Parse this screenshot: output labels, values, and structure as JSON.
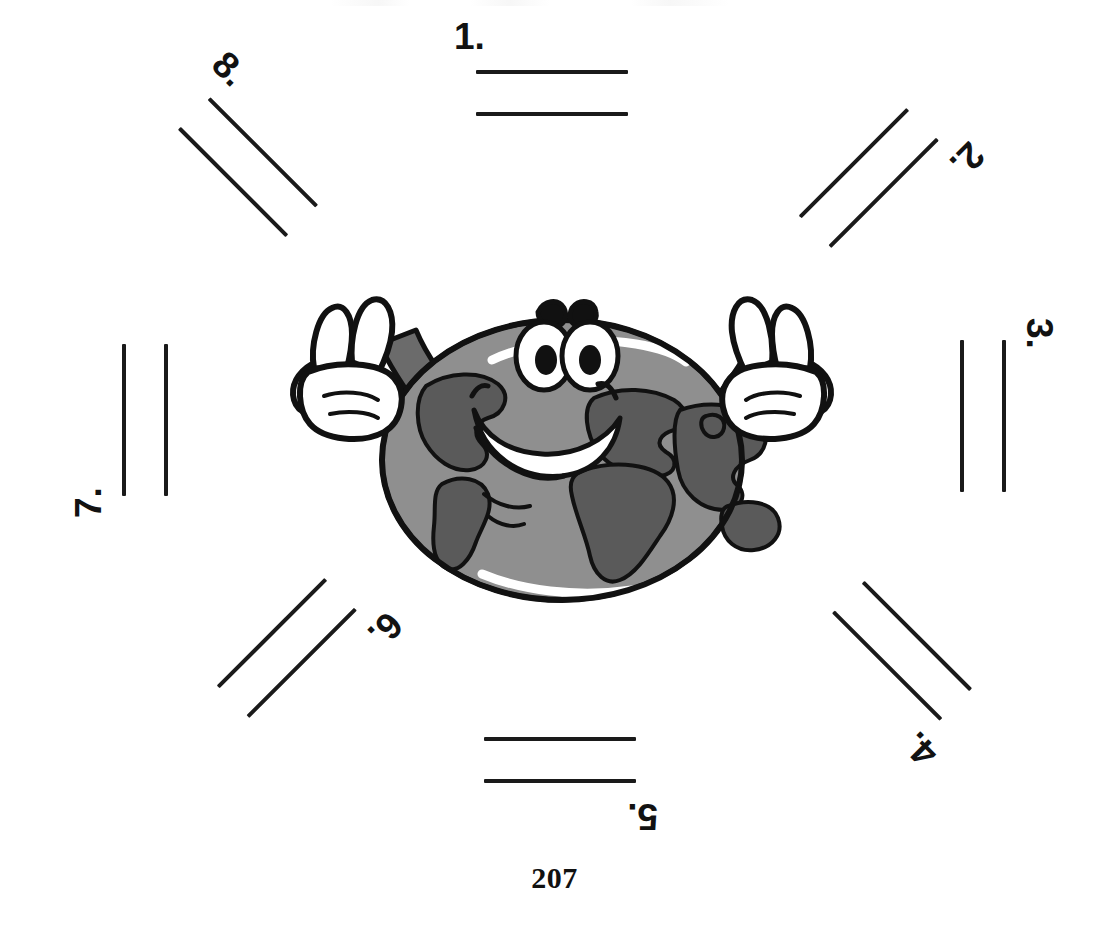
{
  "page": {
    "page_number": "207",
    "background_color": "#ffffff",
    "ink_color": "#1a1a1a"
  },
  "mascot": {
    "name": "smiling-earth-globe-with-peace-sign-hands",
    "globe_ocean_color": "#8f8f8f",
    "globe_land_color": "#5a5a5a",
    "outline_color": "#111111",
    "glove_color": "#ffffff",
    "arm_color": "#6b6b6b",
    "eye_white_color": "#ffffff",
    "pupil_color": "#111111",
    "tongue_color": "#c9c9c9",
    "teeth_color": "#ffffff",
    "expression": "smiling-open-mouth",
    "gesture": "both-hands-v-sign"
  },
  "items": [
    {
      "label": "1.",
      "rotation": 0,
      "left": 454,
      "top": 18,
      "lines": 2
    },
    {
      "label": "2.",
      "rotation": 135,
      "left": 778,
      "top": 130,
      "lines": 2
    },
    {
      "label": "3.",
      "rotation": 90,
      "left": 898,
      "top": 358,
      "lines": 2
    },
    {
      "label": "4.",
      "rotation": 225,
      "left": 790,
      "top": 600,
      "lines": 2
    },
    {
      "label": "5.",
      "rotation": 180,
      "left": 458,
      "top": 715,
      "lines": 2
    },
    {
      "label": "6.",
      "rotation": 135,
      "left": 196,
      "top": 600,
      "lines": 2
    },
    {
      "label": "7.",
      "rotation": 270,
      "left": 30,
      "top": 358,
      "lines": 2
    },
    {
      "label": "8.",
      "rotation": 45,
      "left": 160,
      "top": 98,
      "lines": 2
    }
  ]
}
